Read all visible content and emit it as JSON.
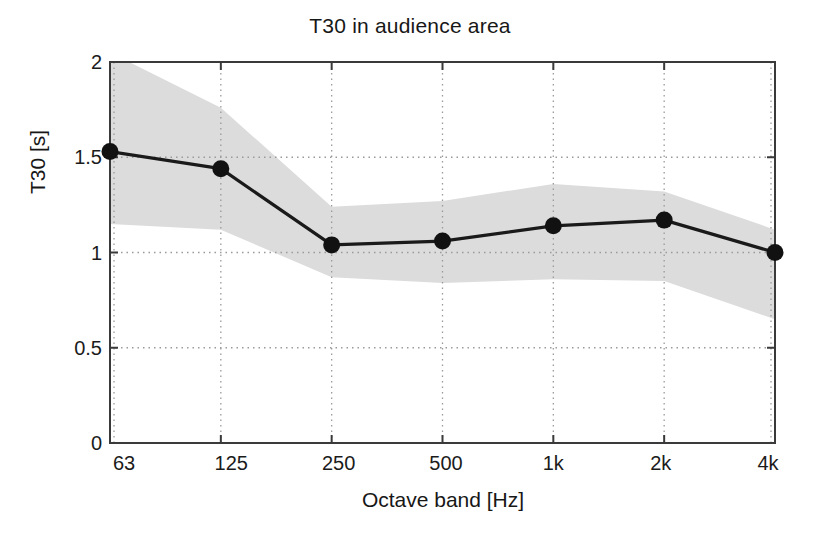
{
  "chart_data": {
    "type": "line",
    "title": "T30 in audience area",
    "xlabel": "Octave band [Hz]",
    "ylabel": "T30 [s]",
    "categories": [
      "63",
      "125",
      "250",
      "500",
      "1k",
      "2k",
      "4k"
    ],
    "xtick_labels": [
      "63",
      "125",
      "250",
      "500",
      "1k",
      "2k",
      "4k"
    ],
    "ytick_labels": [
      "0",
      "0.5",
      "1",
      "1.5",
      "2"
    ],
    "ytick_values": [
      0,
      0.5,
      1,
      1.5,
      2
    ],
    "ylim": [
      0,
      2
    ],
    "grid": "dotted",
    "legend": "none",
    "series": [
      {
        "name": "T30 mean",
        "marker": "filled-circle",
        "values": [
          1.53,
          1.44,
          1.04,
          1.06,
          1.14,
          1.17,
          1.0
        ]
      },
      {
        "name": "T30 spread band (upper)",
        "values": [
          2.05,
          1.76,
          1.24,
          1.27,
          1.36,
          1.32,
          1.12
        ]
      },
      {
        "name": "T30 spread band (lower)",
        "values": [
          1.15,
          1.12,
          0.87,
          0.84,
          0.86,
          0.85,
          0.65
        ]
      }
    ],
    "colors": {
      "line": "#1a1a1a",
      "marker": "#111111",
      "band": "#dcdcdc",
      "axis": "#3a3a3a",
      "grid": "#9a9a9a",
      "background": "#ffffff"
    }
  }
}
